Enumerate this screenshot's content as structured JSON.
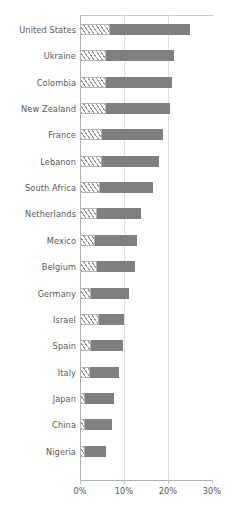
{
  "chart_data": {
    "type": "bar",
    "orientation": "horizontal",
    "title": "",
    "subtitle": "",
    "xlabel": "",
    "ylabel": "",
    "xlim": [
      0,
      30
    ],
    "xtick_labels": [
      "0%",
      "10%",
      "20%",
      "30%"
    ],
    "xtick_values": [
      0,
      10,
      20,
      30
    ],
    "grid": "vertical",
    "legend": "none",
    "categories": [
      "United States",
      "Ukraine",
      "Colombia",
      "New Zealand",
      "France",
      "Lebanon",
      "South Africa",
      "Netherlands",
      "Mexico",
      "Belgium",
      "Germany",
      "Israel",
      "Spain",
      "Italy",
      "Japan",
      "China",
      "Nigeria"
    ],
    "values": [
      25.0,
      21.4,
      21.0,
      20.5,
      18.9,
      18.0,
      16.5,
      13.8,
      12.9,
      12.6,
      11.2,
      10.0,
      9.8,
      8.9,
      7.7,
      7.2,
      5.8
    ],
    "hatched_segment_values": [
      6.8,
      6.0,
      5.9,
      5.9,
      5.0,
      5.0,
      4.5,
      3.9,
      3.5,
      3.9,
      2.5,
      4.3,
      2.5,
      2.3,
      1.2,
      1.2,
      1.2
    ],
    "series": [
      {
        "name": "hatched portion",
        "style": "diagonal-hatch",
        "color": "#ffffff",
        "hatch_color": "#9a9a9a",
        "values": [
          6.8,
          6.0,
          5.9,
          5.9,
          5.0,
          5.0,
          4.5,
          3.9,
          3.5,
          3.9,
          2.5,
          4.3,
          2.5,
          2.3,
          1.2,
          1.2,
          1.2
        ]
      },
      {
        "name": "solid portion",
        "style": "solid",
        "color": "#7f7f7f",
        "values": [
          18.2,
          15.4,
          15.1,
          14.6,
          13.9,
          13.0,
          12.0,
          9.9,
          9.4,
          8.7,
          8.7,
          5.7,
          7.3,
          6.6,
          6.5,
          6.0,
          4.6
        ]
      }
    ]
  },
  "colors": {
    "bar_solid": "#7f7f7f",
    "hatch_line": "#9a9a9a",
    "gridline": "#dedede",
    "axis": "#b0b0b0",
    "text": "#5a5a5a",
    "background": "#ffffff"
  }
}
